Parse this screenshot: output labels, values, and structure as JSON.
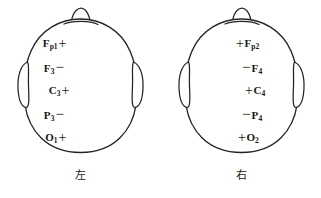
{
  "figure": {
    "type": "eeg-electrode-placement-diagram",
    "background_color": "#ffffff",
    "line_color": "#242424",
    "text_color": "#161616"
  },
  "heads": [
    {
      "id": "left",
      "caption": "左",
      "caption_meaning": "left",
      "nose_position": "top",
      "ears": [
        "left",
        "right"
      ],
      "label_order": "site-then-polarity",
      "electrodes": [
        {
          "site": "F",
          "subscript": "p1",
          "display": "Fp1",
          "polarity": "+",
          "x": 46,
          "y": 41
        },
        {
          "site": "F",
          "subscript": "3",
          "display": "F3",
          "polarity": "−",
          "x": 52,
          "y": 65
        },
        {
          "site": "C",
          "subscript": "3",
          "display": "C3",
          "polarity": "+",
          "x": 48,
          "y": 88
        },
        {
          "site": "P",
          "subscript": "3",
          "display": "P3",
          "polarity": "−",
          "x": 52,
          "y": 112
        },
        {
          "site": "O",
          "subscript": "1",
          "display": "O1",
          "polarity": "+",
          "x": 52,
          "y": 135
        }
      ]
    },
    {
      "id": "right",
      "caption": "右",
      "caption_meaning": "right",
      "nose_position": "top",
      "ears": [
        "left",
        "right"
      ],
      "label_order": "polarity-then-site",
      "electrodes": [
        {
          "site": "F",
          "subscript": "p2",
          "display": "Fp2",
          "polarity": "+",
          "x": 79,
          "y": 41
        },
        {
          "site": "F",
          "subscript": "4",
          "display": "F4",
          "polarity": "−",
          "x": 85,
          "y": 65
        },
        {
          "site": "C",
          "subscript": "4",
          "display": "C4",
          "polarity": "+",
          "x": 88,
          "y": 88
        },
        {
          "site": "P",
          "subscript": "4",
          "display": "P4",
          "polarity": "−",
          "x": 85,
          "y": 112
        },
        {
          "site": "O",
          "subscript": "2",
          "display": "O2",
          "polarity": "+",
          "x": 81,
          "y": 135
        }
      ]
    }
  ]
}
